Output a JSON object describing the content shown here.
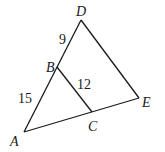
{
  "diagram": {
    "type": "geometry-triangle",
    "points": {
      "A": {
        "label": "A",
        "x": 24,
        "y": 132
      },
      "B": {
        "label": "B",
        "x": 57,
        "y": 67
      },
      "C": {
        "label": "C",
        "x": 92,
        "y": 112
      },
      "D": {
        "label": "D",
        "x": 81,
        "y": 20
      },
      "E": {
        "label": "E",
        "x": 139,
        "y": 98
      }
    },
    "segments": [
      {
        "from": "A",
        "to": "D"
      },
      {
        "from": "D",
        "to": "E"
      },
      {
        "from": "A",
        "to": "E"
      },
      {
        "from": "B",
        "to": "C"
      }
    ],
    "measurements": {
      "DB": "9",
      "BA": "15",
      "BC": "12"
    },
    "stroke_color": "#1a1a1a"
  }
}
